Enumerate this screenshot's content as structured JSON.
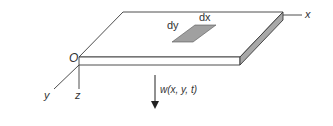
{
  "diagram": {
    "type": "plate-coordinate-diagram",
    "labels": {
      "origin": "O",
      "x_axis": "x",
      "y_axis": "y",
      "z_axis": "z",
      "element_dx": "dx",
      "element_dy": "dy",
      "deflection": "w(x, y, t)"
    },
    "colors": {
      "line": "#3a3a3a",
      "plate_top": "#ffffff",
      "plate_front": "#ffffff",
      "plate_side": "#a8a8a8",
      "element_fill": "#a0a0a0",
      "text": "#333333"
    }
  }
}
